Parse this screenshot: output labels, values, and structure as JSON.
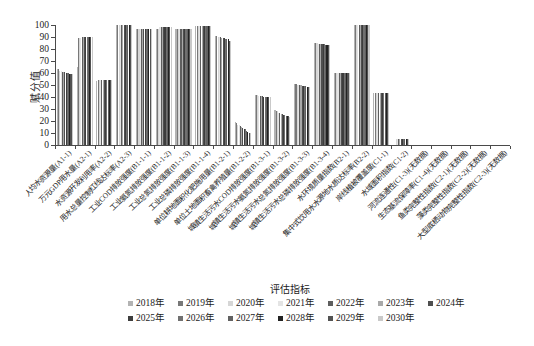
{
  "figure": {
    "y_axis_title": "赋分值",
    "legend_title": "评估指标"
  },
  "chart_data": {
    "type": "bar",
    "title": "",
    "xlabel": "评估指标",
    "ylabel": "赋分值",
    "ylim": [
      0,
      100
    ],
    "ytick_step": 10,
    "grid": false,
    "legend_position": "bottom",
    "legend_rows": [
      [
        0,
        1,
        2,
        3,
        4,
        5,
        6
      ],
      [
        7,
        8,
        9,
        10,
        11,
        12
      ]
    ],
    "series_years": [
      {
        "label": "2018年",
        "color": "#b3b3b3"
      },
      {
        "label": "2019年",
        "color": "#787878"
      },
      {
        "label": "2020年",
        "color": "#d6d6d6"
      },
      {
        "label": "2021年",
        "color": "#e4e4e4"
      },
      {
        "label": "2022年",
        "color": "#5e5e5e"
      },
      {
        "label": "2023年",
        "color": "#a9a9a9"
      },
      {
        "label": "2024年",
        "color": "#4f4f4f"
      },
      {
        "label": "2025年",
        "color": "#3d3d3d"
      },
      {
        "label": "2026年",
        "color": "#707070"
      },
      {
        "label": "2027年",
        "color": "#616161"
      },
      {
        "label": "2028年",
        "color": "#222222"
      },
      {
        "label": "2029年",
        "color": "#525252"
      },
      {
        "label": "2030年",
        "color": "#c9c9c9"
      }
    ],
    "categories": [
      {
        "label": "人均水资源量(A1-1)",
        "values": [
          63,
          63,
          62,
          62,
          61,
          61,
          61,
          60,
          60,
          60,
          59,
          59,
          59
        ]
      },
      {
        "label": "万元GDP用水量(A2-1)",
        "values": [
          65,
          89,
          89,
          89,
          90,
          90,
          90,
          90,
          90,
          90,
          90,
          90,
          90
        ]
      },
      {
        "label": "水资源开发利用率(A2-2)",
        "values": [
          53,
          54,
          54,
          54,
          54,
          54,
          54,
          54,
          54,
          54,
          54,
          54,
          54
        ]
      },
      {
        "label": "用水总量控制红线达标率(A2-3)",
        "values": [
          100,
          100,
          100,
          100,
          100,
          100,
          100,
          100,
          100,
          100,
          100,
          100,
          100
        ]
      },
      {
        "label": "工业COD排放强度(B1-1-1)",
        "values": [
          97,
          97,
          97,
          97,
          97,
          97,
          97,
          97,
          97,
          97,
          97,
          97,
          97
        ]
      },
      {
        "label": "工业氨氮排放强度(B1-1-2)",
        "values": [
          97,
          97,
          97,
          98,
          98,
          98,
          98,
          98,
          98,
          98,
          98,
          98,
          98
        ]
      },
      {
        "label": "工业总氮排放强度(B1-1-3)",
        "values": [
          97,
          97,
          97,
          97,
          97,
          97,
          97,
          97,
          97,
          97,
          97,
          97,
          97
        ]
      },
      {
        "label": "工业总磷排放强度(B1-1-4)",
        "values": [
          99,
          99,
          99,
          99,
          99,
          99,
          99,
          99,
          99,
          99,
          99,
          99,
          99
        ]
      },
      {
        "label": "单位耕地面积化肥施用量(B1-2-1)",
        "values": [
          91,
          91,
          90,
          90,
          90,
          89,
          89,
          89,
          88,
          88,
          88,
          87,
          87
        ]
      },
      {
        "label": "单位土地面积畜禽养殖量(B1-2-2)",
        "values": [
          19,
          18,
          17,
          17,
          16,
          15,
          14,
          13,
          13,
          12,
          11,
          10,
          10
        ]
      },
      {
        "label": "城镇生活污水COD排放强度(B1-3-1)",
        "values": [
          42,
          42,
          42,
          41,
          41,
          41,
          41,
          40,
          40,
          40,
          40,
          40,
          40
        ]
      },
      {
        "label": "城镇生活污水氨氮排放强度(B1-3-2)",
        "values": [
          29,
          28,
          28,
          27,
          27,
          26,
          26,
          25,
          25,
          24,
          24,
          24,
          23
        ]
      },
      {
        "label": "城镇生活污水总氮排放强度(B1-3-3)",
        "values": [
          51,
          51,
          50,
          50,
          50,
          50,
          49,
          49,
          49,
          49,
          48,
          48,
          48
        ]
      },
      {
        "label": "城镇生活污水总磷排放强度(B1-3-4)",
        "values": [
          85,
          85,
          85,
          84,
          84,
          84,
          84,
          84,
          84,
          83,
          83,
          83,
          83
        ]
      },
      {
        "label": "水环境质量指数(B2-1)",
        "values": [
          60,
          60,
          60,
          60,
          60,
          60,
          60,
          60,
          60,
          60,
          60,
          60,
          60
        ]
      },
      {
        "label": "集中式饮用水水源地水质达标率(B2-2)",
        "values": [
          100,
          100,
          100,
          100,
          100,
          100,
          100,
          100,
          100,
          100,
          100,
          100,
          100
        ]
      },
      {
        "label": "岸线植被覆盖度(C1-1)",
        "values": [
          43,
          43,
          43,
          43,
          43,
          43,
          43,
          43,
          43,
          43,
          43,
          43,
          43
        ]
      },
      {
        "label": "水域面积指数(C1-2)",
        "values": [
          0,
          0,
          5,
          5,
          5,
          5,
          5,
          5,
          5,
          5,
          5,
          5,
          5
        ]
      },
      {
        "label": "河流连通性(C1-3)(无数据)",
        "values": [
          0,
          0,
          0,
          0,
          0,
          0,
          0,
          0,
          0,
          0,
          0,
          0,
          0
        ]
      },
      {
        "label": "生态基流保障率(C1-4)(无数据)",
        "values": [
          0,
          0,
          0,
          0,
          0,
          0,
          0,
          0,
          0,
          0,
          0,
          0,
          0
        ]
      },
      {
        "label": "鱼类完整性指数(C2-1)(无数据)",
        "values": [
          0,
          0,
          0,
          0,
          0,
          0,
          0,
          0,
          0,
          0,
          0,
          0,
          0
        ]
      },
      {
        "label": "藻类完整性指数(C2-2)(无数据)",
        "values": [
          0,
          0,
          0,
          0,
          0,
          0,
          0,
          0,
          0,
          0,
          0,
          0,
          0
        ]
      },
      {
        "label": "大型底栖动物完整性指数(C2-3)(无数据)",
        "values": [
          0,
          0,
          0,
          0,
          0,
          0,
          0,
          0,
          0,
          0,
          0,
          0,
          0
        ]
      }
    ]
  }
}
